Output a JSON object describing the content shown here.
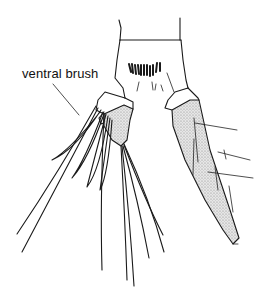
{
  "figure": {
    "labels": [
      {
        "text": "ventral brush",
        "points_to": "ventral brush setae"
      }
    ],
    "colors": {
      "line": "#1a1a1a",
      "background": "#ffffff",
      "stipple": "#9a9a9a"
    }
  }
}
